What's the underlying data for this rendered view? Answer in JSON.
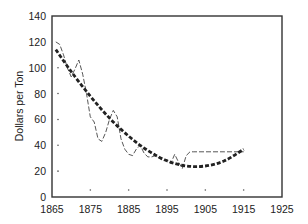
{
  "chart_data": {
    "type": "line",
    "title": "",
    "xlabel": "",
    "ylabel": "Dollars per Ton",
    "xlim": [
      1865,
      1925
    ],
    "ylim": [
      0,
      140
    ],
    "xticks": [
      1865,
      1875,
      1885,
      1895,
      1905,
      1915,
      1925
    ],
    "yticks": [
      0,
      20,
      40,
      60,
      80,
      100,
      120,
      140
    ],
    "grid": false,
    "legend": null,
    "series": [
      {
        "name": "Observed price",
        "style": "thin-dashed",
        "x": [
          1866,
          1867,
          1868,
          1869,
          1870,
          1871,
          1872,
          1873,
          1874,
          1875,
          1876,
          1877,
          1878,
          1879,
          1880,
          1881,
          1882,
          1883,
          1884,
          1885,
          1886,
          1887,
          1888,
          1889,
          1890,
          1891,
          1892,
          1893,
          1894,
          1895,
          1896,
          1897,
          1898,
          1899,
          1900,
          1901,
          1902,
          1905,
          1910,
          1915
        ],
        "values": [
          120,
          118,
          110,
          100,
          93,
          99,
          106,
          95,
          80,
          62,
          58,
          45,
          43,
          50,
          60,
          67,
          62,
          45,
          37,
          33,
          32,
          37,
          40,
          34,
          31,
          31,
          32,
          30,
          28,
          29,
          26,
          33,
          27,
          22,
          32,
          35,
          35,
          35,
          35,
          35
        ]
      },
      {
        "name": "Fitted trend",
        "style": "thick-dashed",
        "x": [
          1866,
          1870,
          1875,
          1880,
          1885,
          1890,
          1895,
          1900,
          1905,
          1910,
          1915
        ],
        "values": [
          114,
          97,
          78,
          61,
          47,
          36,
          28,
          24,
          24,
          28,
          37
        ]
      }
    ],
    "annotations": [
      "small dot marks along y-axis near x=1867 at y=20,40,60,80,100; dot marks along bottom at x=1875,1885,1895,1905,1915"
    ]
  }
}
